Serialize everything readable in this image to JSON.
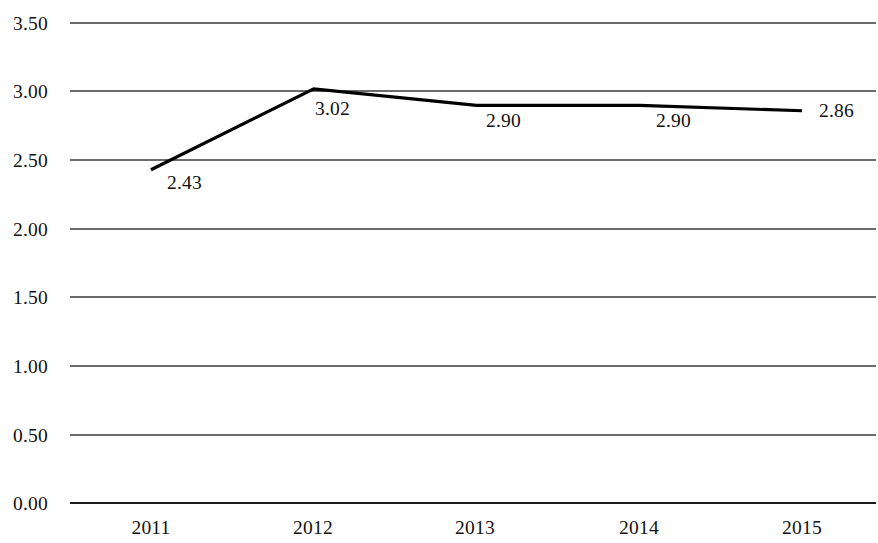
{
  "chart_data": {
    "type": "line",
    "title": "",
    "subtitle": "",
    "xlabel": "",
    "ylabel": "",
    "categories": [
      "2011",
      "2012",
      "2013",
      "2014",
      "2015"
    ],
    "values": [
      2.43,
      3.02,
      2.9,
      2.9,
      2.86
    ],
    "point_labels": [
      "2.43",
      "3.02",
      "2.90",
      "2.90",
      "2.86"
    ],
    "series": [
      {
        "name": "",
        "values": [
          2.43,
          3.02,
          2.9,
          2.9,
          2.86
        ]
      }
    ],
    "ylim": [
      0.0,
      3.5
    ],
    "ytick_values": [
      3.5,
      3.0,
      2.5,
      2.0,
      1.5,
      1.0,
      0.5,
      0.0
    ],
    "ytick_labels": [
      "3.50",
      "3.00",
      "2.50",
      "2.00",
      "1.50",
      "1.00",
      "0.50",
      "0.00"
    ],
    "grid": "horizontal",
    "legend": "none",
    "line_color": "#000000",
    "grid_color": "#3a3a3a",
    "background_color": "#ffffff"
  },
  "axis": {
    "y": {
      "t0": "3.50",
      "t1": "3.00",
      "t2": "2.50",
      "t3": "2.00",
      "t4": "1.50",
      "t5": "1.00",
      "t6": "0.50",
      "t7": "0.00"
    },
    "x": {
      "t0": "2011",
      "t1": "2012",
      "t2": "2013",
      "t3": "2014",
      "t4": "2015"
    }
  },
  "labels": {
    "p0": "2.43",
    "p1": "3.02",
    "p2": "2.90",
    "p3": "2.90",
    "p4": "2.86"
  }
}
